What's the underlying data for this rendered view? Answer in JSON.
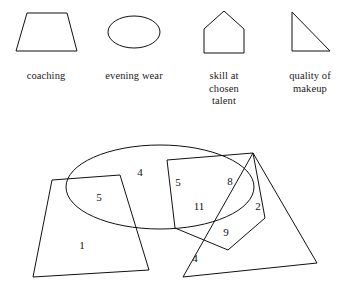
{
  "legend": {
    "items": [
      {
        "shape": "trapezoid",
        "label": "coaching"
      },
      {
        "shape": "ellipse",
        "label": "evening wear"
      },
      {
        "shape": "pentagon-house",
        "label": "skill at\nchosen\ntalent"
      },
      {
        "shape": "right-triangle",
        "label": "quality of\nmakeup"
      }
    ]
  },
  "chart_data": {
    "type": "diagram",
    "diagram_kind": "venn",
    "title": "",
    "sets": [
      {
        "name": "coaching",
        "shape": "trapezoid"
      },
      {
        "name": "evening wear",
        "shape": "ellipse"
      },
      {
        "name": "skill at chosen talent",
        "shape": "pentagon-house"
      },
      {
        "name": "quality of makeup",
        "shape": "right-triangle"
      }
    ],
    "regions": [
      {
        "id": "r1",
        "label": "1",
        "x": 82,
        "y": 245,
        "sets": [
          "coaching"
        ]
      },
      {
        "id": "r2",
        "label": "5",
        "x": 99,
        "y": 197,
        "sets": [
          "coaching",
          "evening wear"
        ]
      },
      {
        "id": "r3",
        "label": "4",
        "x": 140,
        "y": 172,
        "sets": [
          "evening wear"
        ]
      },
      {
        "id": "r4",
        "label": "5",
        "x": 178,
        "y": 182,
        "sets": [
          "skill at chosen talent",
          "evening wear"
        ]
      },
      {
        "id": "r5",
        "label": "11",
        "x": 199,
        "y": 206,
        "sets": [
          "skill at chosen talent",
          "evening wear",
          "quality of makeup"
        ]
      },
      {
        "id": "r6",
        "label": "8",
        "x": 230,
        "y": 181,
        "sets": [
          "evening wear",
          "quality of makeup"
        ]
      },
      {
        "id": "r7",
        "label": "2",
        "x": 258,
        "y": 206,
        "sets": [
          "quality of makeup"
        ]
      },
      {
        "id": "r8",
        "label": "9",
        "x": 226,
        "y": 232,
        "sets": [
          "skill at chosen talent",
          "quality of makeup"
        ]
      },
      {
        "id": "r9",
        "label": "4",
        "x": 195,
        "y": 258,
        "sets": [
          "quality of makeup"
        ]
      }
    ],
    "counts": [
      1,
      5,
      4,
      5,
      11,
      8,
      2,
      9,
      4
    ]
  },
  "colors": {
    "stroke": "#111111",
    "background": "#ffffff",
    "text": "#1a1a1a"
  }
}
